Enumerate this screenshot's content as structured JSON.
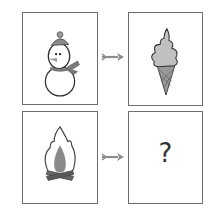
{
  "puzzle": {
    "pairs": [
      {
        "source": {
          "icon": "snowman-icon"
        },
        "arrow": "arrow-right-icon",
        "target": {
          "icon": "ice-cream-cone-icon"
        }
      },
      {
        "source": {
          "icon": "campfire-icon"
        },
        "arrow": "arrow-right-icon",
        "target": {
          "text": "?"
        }
      }
    ]
  },
  "colors": {
    "border": "#6e6e6e",
    "arrow": "#8c8c8c",
    "icon_fill": "#b0b0b0",
    "icon_dark": "#707070"
  }
}
